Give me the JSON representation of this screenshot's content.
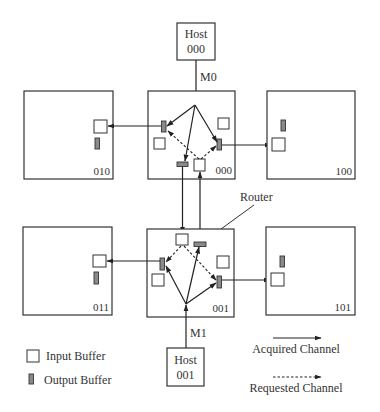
{
  "diagram": {
    "hosts": [
      {
        "id": "host-000",
        "line1": "Host",
        "line2": "000",
        "message": "M0"
      },
      {
        "id": "host-001",
        "line1": "Host",
        "line2": "001",
        "message": "M1"
      }
    ],
    "routers": [
      {
        "id": "router-010",
        "label": "010"
      },
      {
        "id": "router-000",
        "label": "000"
      },
      {
        "id": "router-100",
        "label": "100"
      },
      {
        "id": "router-011",
        "label": "011"
      },
      {
        "id": "router-001",
        "label": "001"
      },
      {
        "id": "router-101",
        "label": "101"
      }
    ],
    "router_callout": "Router",
    "legend": {
      "input_buffer": "Input Buffer",
      "output_buffer": "Output Buffer",
      "acquired_channel": "Acquired Channel",
      "requested_channel": "Requested Channel"
    },
    "colors": {
      "line": "#222222",
      "box_stroke": "#333333",
      "output_buffer_fill": "#8a8a8a",
      "input_buffer_fill": "#ffffff",
      "caption_text": "#999999"
    },
    "caption": ""
  }
}
